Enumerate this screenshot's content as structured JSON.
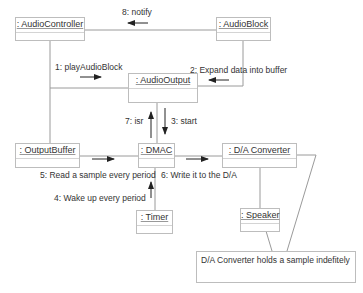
{
  "diagram": {
    "type": "uml-communication-diagram",
    "objects": [
      {
        "id": "audio_controller",
        "label": ": AudioController"
      },
      {
        "id": "audio_block",
        "label": ": AudioBlock"
      },
      {
        "id": "audio_output",
        "label": ": AudioOutput"
      },
      {
        "id": "output_buffer",
        "label": ": OutputBuffer"
      },
      {
        "id": "dmac",
        "label": ": DMAC"
      },
      {
        "id": "da_converter",
        "label": ": D/A Converter"
      },
      {
        "id": "timer",
        "label": ": Timer"
      },
      {
        "id": "speaker",
        "label": ": Speaker"
      }
    ],
    "messages": [
      {
        "label": "1: playAudioBlock",
        "from": "audio_controller",
        "to": "audio_output"
      },
      {
        "label": "2: Expand data into buffer",
        "from": "audio_block",
        "to": "audio_output"
      },
      {
        "label": "3: start",
        "from": "audio_output",
        "to": "dmac"
      },
      {
        "label": "4: Wake up every period",
        "from": "timer",
        "to": "dmac"
      },
      {
        "label": "5: Read a sample every period",
        "from": "output_buffer",
        "to": "dmac"
      },
      {
        "label": "6: Write it to the D/A",
        "from": "dmac",
        "to": "da_converter"
      },
      {
        "label": "7: isr",
        "from": "dmac",
        "to": "audio_output"
      },
      {
        "label": "8: notify",
        "from": "audio_block",
        "to": "audio_controller"
      }
    ],
    "note": {
      "text": "D/A Converter holds a sample indefitely",
      "attached_to": "da_converter"
    }
  }
}
